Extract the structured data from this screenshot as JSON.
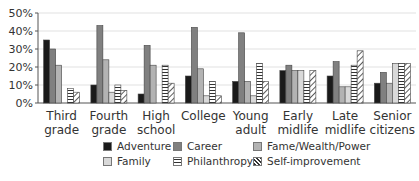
{
  "chart_data": {
    "type": "bar",
    "title": "",
    "xlabel": "",
    "ylabel": "",
    "ylim": [
      0,
      50
    ],
    "yticks": [
      "0%",
      "10%",
      "20%",
      "30%",
      "40%",
      "50%"
    ],
    "grid": true,
    "legend_position": "bottom",
    "categories": [
      [
        "Third",
        "grade"
      ],
      [
        "Fourth",
        "grade"
      ],
      [
        "High",
        "school"
      ],
      [
        "College",
        ""
      ],
      [
        "Young",
        "adult"
      ],
      [
        "Early",
        "midlife"
      ],
      [
        "Late",
        "midlife"
      ],
      [
        "Senior",
        "citizens"
      ]
    ],
    "series": [
      {
        "name": "Adventure",
        "fill": "#1a1a1a",
        "pattern": "solid",
        "values": [
          35,
          10,
          5,
          15,
          12,
          18,
          15,
          11
        ]
      },
      {
        "name": "Career",
        "fill": "#808080",
        "pattern": "solid",
        "values": [
          30,
          43,
          32,
          42,
          39,
          21,
          23,
          17
        ]
      },
      {
        "name": "Fame/Wealth/Power",
        "fill": "#b3b3b3",
        "pattern": "solid",
        "values": [
          21,
          24,
          21,
          19,
          12,
          18,
          9,
          11
        ]
      },
      {
        "name": "Family",
        "fill": "#d9d9d9",
        "pattern": "solid",
        "values": [
          0,
          6,
          0,
          4,
          4,
          18,
          9,
          22
        ]
      },
      {
        "name": "Philanthropy",
        "fill": "#ffffff",
        "pattern": "horizontal",
        "values": [
          8,
          10,
          21,
          12,
          22,
          12,
          21,
          22
        ]
      },
      {
        "name": "Self-improvement",
        "fill": "#ffffff",
        "pattern": "diagonal",
        "values": [
          6,
          7,
          11,
          4,
          12,
          18,
          29,
          22
        ]
      }
    ]
  },
  "legend": {
    "items": [
      {
        "label": "Adventure"
      },
      {
        "label": "Career"
      },
      {
        "label": "Fame/Wealth/Power"
      },
      {
        "label": "Family"
      },
      {
        "label": "Philanthropy"
      },
      {
        "label": "Self-improvement"
      }
    ]
  }
}
